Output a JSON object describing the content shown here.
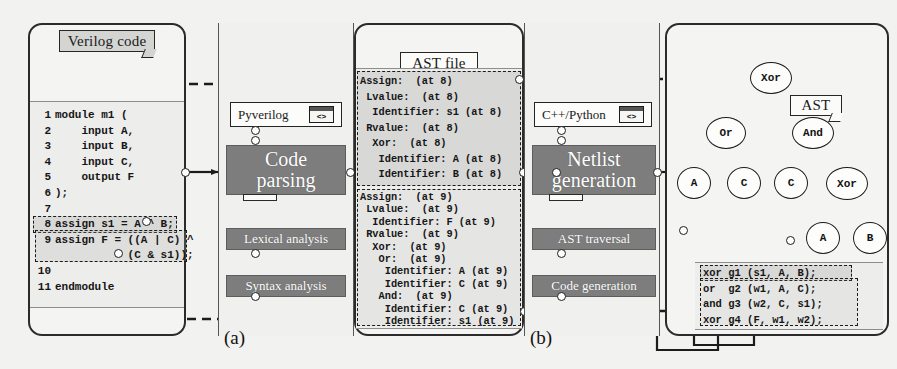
{
  "figure": {
    "caption_a": "(a)",
    "caption_b": "(b)"
  },
  "panel_verilog": {
    "title": "Verilog code",
    "code_lines": [
      {
        "n": "1",
        "text": "module m1 ("
      },
      {
        "n": "2",
        "text": "    input A,"
      },
      {
        "n": "3",
        "text": "    input B,"
      },
      {
        "n": "4",
        "text": "    input C,"
      },
      {
        "n": "5",
        "text": "    output F"
      },
      {
        "n": "6",
        "text": ");"
      },
      {
        "n": "7",
        "text": ""
      },
      {
        "n": "8",
        "text": "assign s1 = A ^ B;"
      },
      {
        "n": "9",
        "text": "assign F = ((A | C) ^"
      },
      {
        "n": "",
        "text": "           (C & s1));"
      },
      {
        "n": "10",
        "text": ""
      },
      {
        "n": "11",
        "text": "endmodule"
      }
    ]
  },
  "panel_parsing": {
    "tool_label": "Pyverilog",
    "tool_icon": "code-window-icon",
    "icon_glyph": "<>",
    "main_box": "Code parsing",
    "main_box_line1": "Code",
    "main_box_line2": "parsing",
    "step1": "Lexical analysis",
    "step2": "Syntax analysis"
  },
  "panel_ast_file": {
    "title": "AST file",
    "block1": [
      "Assign:  (at 8)",
      " Lvalue:  (at 8)",
      "  Identifier: s1 (at 8)",
      " Rvalue:  (at 8)",
      "  Xor:  (at 8)",
      "   Identifier: A (at 8)",
      "   Identifier: B (at 8)"
    ],
    "block2": [
      "Assign:  (at 9)",
      " Lvalue:  (at 9)",
      "  Identifier: F (at 9)",
      " Rvalue:  (at 9)",
      "  Xor:  (at 9)",
      "   Or:  (at 9)",
      "    Identifier: A (at 9)",
      "    Identifier: C (at 9)",
      "   And:  (at 9)",
      "    Identifier: C (at 9)",
      "    Identifier: s1 (at 9)"
    ]
  },
  "panel_netlist_gen": {
    "tool_label": "C++/Python",
    "tool_icon": "code-window-icon",
    "icon_glyph": "<>",
    "main_box": "Netlist generation",
    "main_box_line1": "Netlist",
    "main_box_line2": "generation",
    "step1": "AST traversal",
    "step2": "Code generation"
  },
  "panel_result": {
    "ast_title": "AST",
    "netlist_title": "Netlist",
    "tree_nodes": [
      {
        "id": "root",
        "label": "Xor"
      },
      {
        "id": "l1a",
        "label": "Or"
      },
      {
        "id": "l1b",
        "label": "And"
      },
      {
        "id": "l2a",
        "label": "A"
      },
      {
        "id": "l2b",
        "label": "C"
      },
      {
        "id": "l2c",
        "label": "C"
      },
      {
        "id": "l2d",
        "label": "Xor"
      },
      {
        "id": "l3a",
        "label": "A"
      },
      {
        "id": "l3b",
        "label": "B"
      }
    ],
    "netlist_lines": [
      "xor g1 (s1, A, B);",
      "or  g2 (w1, A, C);",
      "and g3 (w2, C, s1);",
      "xor g4 (F, w1, w2);"
    ]
  },
  "colors": {
    "process_box": "#7d7d7d",
    "panel_bg": "#f4f4f2",
    "tag_bg": "#d4d4d2",
    "line": "#1c1c1c",
    "highlight": "#aaaaaa"
  }
}
